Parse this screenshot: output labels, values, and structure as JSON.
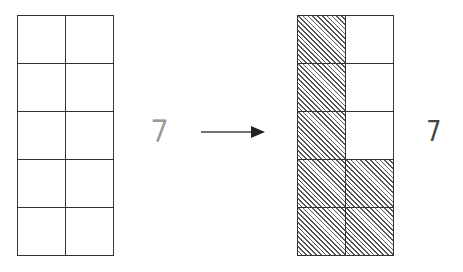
{
  "diagram": {
    "left_grid": {
      "rows": 5,
      "cols": 2,
      "shaded": [
        [
          false,
          false
        ],
        [
          false,
          false
        ],
        [
          false,
          false
        ],
        [
          false,
          false
        ],
        [
          false,
          false
        ]
      ]
    },
    "left_label": "7",
    "arrow": {
      "direction": "right"
    },
    "right_grid": {
      "rows": 5,
      "cols": 2,
      "shaded": [
        [
          true,
          false
        ],
        [
          true,
          false
        ],
        [
          true,
          false
        ],
        [
          true,
          true
        ],
        [
          true,
          true
        ]
      ]
    },
    "right_label": "7",
    "colors": {
      "line": "#333333",
      "hatch": "#555555",
      "background": "#ffffff"
    }
  }
}
